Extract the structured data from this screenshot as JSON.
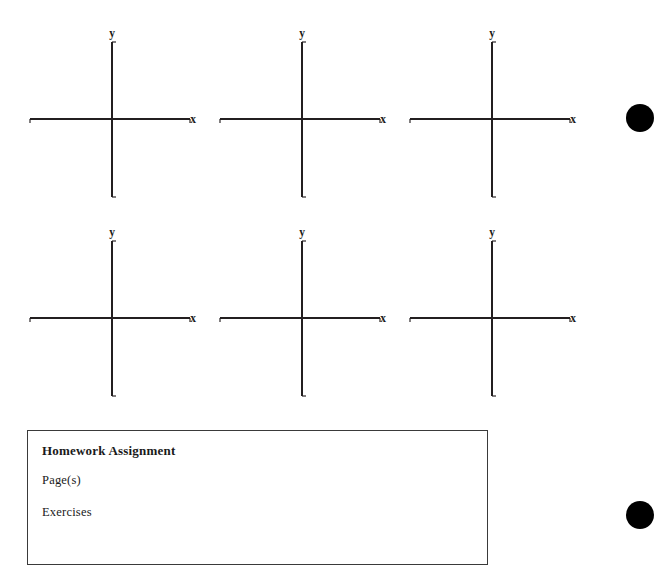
{
  "page": {
    "background_color": "#ffffff",
    "ink_color": "#231f20",
    "width": 672,
    "height": 585
  },
  "worksheet": {
    "grid_count": 6,
    "rows": 2,
    "columns": 3,
    "grids": [
      {
        "id": "grid-1",
        "row": 1,
        "column": 1,
        "x_axis_label": "x",
        "y_axis_label": "y",
        "left": 22,
        "top": 28
      },
      {
        "id": "grid-2",
        "row": 1,
        "column": 2,
        "x_axis_label": "x",
        "y_axis_label": "y",
        "left": 212,
        "top": 28
      },
      {
        "id": "grid-3",
        "row": 1,
        "column": 3,
        "x_axis_label": "x",
        "y_axis_label": "y",
        "left": 402,
        "top": 28
      },
      {
        "id": "grid-4",
        "row": 2,
        "column": 1,
        "x_axis_label": "x",
        "y_axis_label": "y",
        "left": 22,
        "top": 227
      },
      {
        "id": "grid-5",
        "row": 2,
        "column": 2,
        "x_axis_label": "x",
        "y_axis_label": "y",
        "left": 212,
        "top": 227
      },
      {
        "id": "grid-6",
        "row": 2,
        "column": 3,
        "x_axis_label": "x",
        "y_axis_label": "y",
        "left": 402,
        "top": 227
      }
    ]
  },
  "homework": {
    "title": "Homework Assignment",
    "pages_label": "Page(s)",
    "exercises_label": "Exercises",
    "border_color": "#3a3a3a"
  },
  "marks": {
    "dot_color": "#000000",
    "dots": [
      {
        "id": "dot-top",
        "center_x": 640,
        "center_y": 118,
        "radius": 14
      },
      {
        "id": "dot-bottom",
        "center_x": 640,
        "center_y": 515,
        "radius": 14
      }
    ]
  }
}
